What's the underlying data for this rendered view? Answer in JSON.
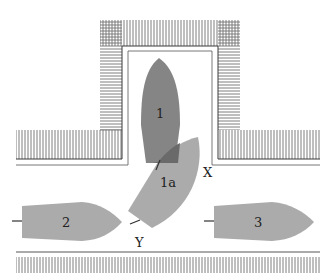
{
  "diagram": {
    "colors": {
      "background": "#ffffff",
      "hatch": "#6f6f6f",
      "outline": "#3a3a3a",
      "boat_1": "#858585",
      "boat_1a": "#a6a6a6",
      "boat_overlap": "#6a6a6a",
      "boat_2": "#ababab",
      "boat_3": "#ababab"
    },
    "boats": [
      {
        "id": "1",
        "label": "1",
        "description": "Boat in berth, bow pointing up"
      },
      {
        "id": "1a",
        "label": "1a",
        "description": "Same boat reversing out, rotated"
      },
      {
        "id": "2",
        "label": "2",
        "description": "Boat moored left, bow pointing right"
      },
      {
        "id": "3",
        "label": "3",
        "description": "Boat moored right, bow pointing right"
      }
    ],
    "points": [
      {
        "id": "X",
        "label": "X"
      },
      {
        "id": "Y",
        "label": "Y"
      }
    ]
  }
}
